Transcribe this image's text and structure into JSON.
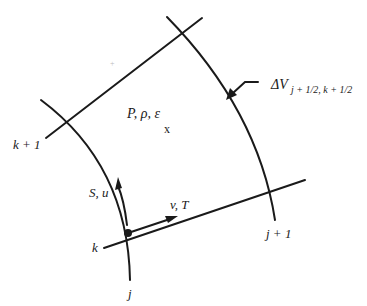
{
  "diagram": {
    "grid_lines": {
      "k": "k",
      "k_plus_1": "k + 1",
      "j": "j",
      "j_plus_1": "j + 1"
    },
    "cell_center": {
      "variables": "P,  ρ,  ε",
      "marker": "x"
    },
    "vectors": {
      "along_j": "S, u",
      "along_k": "v, T"
    },
    "volume_label": {
      "prefix": "ΔV",
      "subscript": "j + 1/2, k + 1/2"
    },
    "colors": {
      "line": "#1a1a1a",
      "background": "#ffffff"
    }
  }
}
